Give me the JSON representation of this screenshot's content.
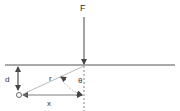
{
  "diagram": {
    "labels": {
      "force": "F",
      "depth": "d",
      "radius": "r",
      "angle": "θ",
      "horizontal": "x"
    },
    "colors": {
      "line": "#555555",
      "light_line": "#aaaaaa",
      "text": "#333333"
    }
  }
}
